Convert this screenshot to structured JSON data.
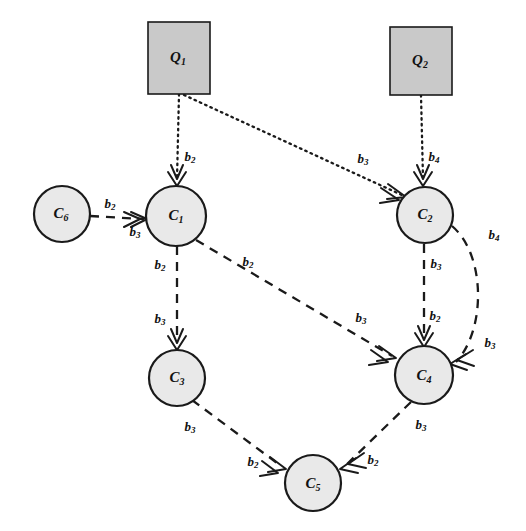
{
  "diagram": {
    "canvas": {
      "width": 526,
      "height": 531,
      "background": "#ffffff"
    },
    "style": {
      "circle_fill": "#e9e9e9",
      "square_fill": "#c9c9c9",
      "stroke": "#1a1a1a"
    },
    "nodes": [
      {
        "id": "Q1",
        "base": "Q",
        "sub": "1",
        "shape": "square",
        "x": 179,
        "y": 58,
        "w": 62,
        "h": 72
      },
      {
        "id": "Q2",
        "base": "Q",
        "sub": "2",
        "shape": "square",
        "x": 421,
        "y": 61,
        "w": 62,
        "h": 68
      },
      {
        "id": "C6",
        "base": "C",
        "sub": "6",
        "shape": "circle",
        "x": 62,
        "y": 214,
        "r": 28
      },
      {
        "id": "C1",
        "base": "C",
        "sub": "1",
        "shape": "circle",
        "x": 176,
        "y": 216,
        "r": 30
      },
      {
        "id": "C2",
        "base": "C",
        "sub": "2",
        "shape": "circle",
        "x": 425,
        "y": 215,
        "r": 28
      },
      {
        "id": "C3",
        "base": "C",
        "sub": "3",
        "shape": "circle",
        "x": 177,
        "y": 378,
        "r": 28
      },
      {
        "id": "C4",
        "base": "C",
        "sub": "4",
        "shape": "circle",
        "x": 424,
        "y": 375,
        "r": 29
      },
      {
        "id": "C5",
        "base": "C",
        "sub": "5",
        "shape": "circle",
        "x": 313,
        "y": 483,
        "r": 28
      }
    ],
    "edges": [
      {
        "id": "Q1-C1",
        "from": "Q1",
        "to": "C1",
        "style": "dotted",
        "labels": [
          "b2"
        ]
      },
      {
        "id": "Q1-C2",
        "from": "Q1",
        "to": "C2",
        "style": "dotted",
        "labels": [
          "b3"
        ]
      },
      {
        "id": "Q2-C2",
        "from": "Q2",
        "to": "C2",
        "style": "dotted",
        "labels": [
          "b4"
        ]
      },
      {
        "id": "C6-C1",
        "from": "C6",
        "to": "C1",
        "style": "dashed",
        "labels": [
          "b2",
          "b3"
        ]
      },
      {
        "id": "C1-C3",
        "from": "C1",
        "to": "C3",
        "style": "dashed",
        "labels": [
          "b2",
          "b3"
        ]
      },
      {
        "id": "C1-C4",
        "from": "C1",
        "to": "C4",
        "style": "dashed",
        "labels": [
          "b2",
          "b3"
        ]
      },
      {
        "id": "C2-C4",
        "from": "C2",
        "to": "C4",
        "style": "dashed",
        "labels": [
          "b3",
          "b2"
        ]
      },
      {
        "id": "C2-C4-curve",
        "from": "C2",
        "to": "C4",
        "style": "dashed-curved",
        "labels": [
          "b4",
          "b3"
        ]
      },
      {
        "id": "C3-C5",
        "from": "C3",
        "to": "C5",
        "style": "dashed",
        "labels": [
          "b3",
          "b2"
        ]
      },
      {
        "id": "C4-C5",
        "from": "C4",
        "to": "C5",
        "style": "dashed",
        "labels": [
          "b3",
          "b2"
        ]
      }
    ],
    "edge_labels": [
      {
        "id": "lbl-q1c1",
        "base": "b",
        "sub": "2",
        "x": 190,
        "y": 158
      },
      {
        "id": "lbl-q1c2",
        "base": "b",
        "sub": "3",
        "x": 363,
        "y": 160
      },
      {
        "id": "lbl-q2c2",
        "base": "b",
        "sub": "4",
        "x": 434,
        "y": 158
      },
      {
        "id": "lbl-c6c1-a",
        "base": "b",
        "sub": "2",
        "x": 110,
        "y": 205
      },
      {
        "id": "lbl-c6c1-b",
        "base": "b",
        "sub": "3",
        "x": 135,
        "y": 233
      },
      {
        "id": "lbl-c1c3-a",
        "base": "b",
        "sub": "2",
        "x": 160,
        "y": 266
      },
      {
        "id": "lbl-c1c3-b",
        "base": "b",
        "sub": "3",
        "x": 160,
        "y": 320
      },
      {
        "id": "lbl-c1c4-a",
        "base": "b",
        "sub": "2",
        "x": 248,
        "y": 263
      },
      {
        "id": "lbl-c1c4-b",
        "base": "b",
        "sub": "3",
        "x": 361,
        "y": 319
      },
      {
        "id": "lbl-c2c4-a",
        "base": "b",
        "sub": "3",
        "x": 436,
        "y": 265
      },
      {
        "id": "lbl-c2c4-b",
        "base": "b",
        "sub": "2",
        "x": 435,
        "y": 317
      },
      {
        "id": "lbl-curve-a",
        "base": "b",
        "sub": "4",
        "x": 494,
        "y": 236
      },
      {
        "id": "lbl-curve-b",
        "base": "b",
        "sub": "3",
        "x": 490,
        "y": 344
      },
      {
        "id": "lbl-c3c5-a",
        "base": "b",
        "sub": "3",
        "x": 190,
        "y": 428
      },
      {
        "id": "lbl-c3c5-b",
        "base": "b",
        "sub": "2",
        "x": 253,
        "y": 463
      },
      {
        "id": "lbl-c4c5-a",
        "base": "b",
        "sub": "3",
        "x": 421,
        "y": 426
      },
      {
        "id": "lbl-c4c5-b",
        "base": "b",
        "sub": "2",
        "x": 373,
        "y": 461
      }
    ]
  }
}
